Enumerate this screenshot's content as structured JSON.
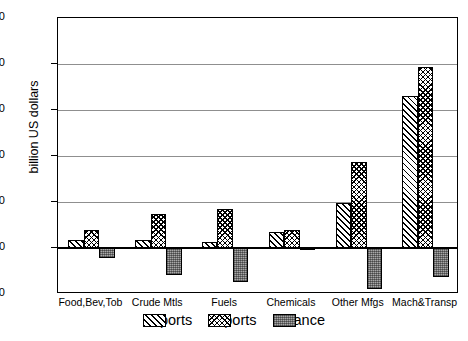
{
  "chart_data": {
    "type": "bar",
    "title": "",
    "subtitle": "",
    "xlabel": "",
    "ylabel": "billion US dollars",
    "ylim": [
      -10,
      50
    ],
    "yticks": [
      -10,
      0,
      10,
      20,
      30,
      40,
      50
    ],
    "grid": true,
    "grid_axis": "y",
    "legend_position": "bottom",
    "categories": [
      "Food,Bev,Tob",
      "Crude Mtls",
      "Fuels",
      "Chemicals",
      "Other Mfgs",
      "Mach&Transp"
    ],
    "series": [
      {
        "name": "Exports",
        "values": [
          1.8,
          1.7,
          1.3,
          3.5,
          9.7,
          33.0
        ]
      },
      {
        "name": "Imports",
        "values": [
          4.0,
          7.5,
          8.5,
          4.0,
          18.7,
          39.3
        ]
      },
      {
        "name": "Balance",
        "values": [
          -2.1,
          -5.8,
          -7.3,
          -0.4,
          -8.9,
          -6.3
        ]
      }
    ],
    "annotations": []
  },
  "axis": {
    "y_title": "billion US dollars",
    "y_tick_labels": [
      "50",
      "40",
      "30",
      "20",
      "10",
      "0",
      "-10"
    ],
    "x_tick_labels": [
      "Food,Bev,Tob",
      "Crude Mtls",
      "Fuels",
      "Chemicals",
      "Other Mfgs",
      "Mach&Transp"
    ]
  },
  "legend": {
    "entries": [
      {
        "label": "Exports",
        "pattern": "diagonal-hatch",
        "color": "#ffffff"
      },
      {
        "label": "Imports",
        "pattern": "checkerboard",
        "color": "#ffffff"
      },
      {
        "label": "Balance",
        "pattern": "gray-dotted",
        "color": "#a8a8a8"
      }
    ]
  },
  "colors": {
    "frame": "#000000",
    "gridline": "#8f8f8f",
    "zeroline": "#000000",
    "balance_fill": "#a8a8a8",
    "background": "#ffffff"
  }
}
